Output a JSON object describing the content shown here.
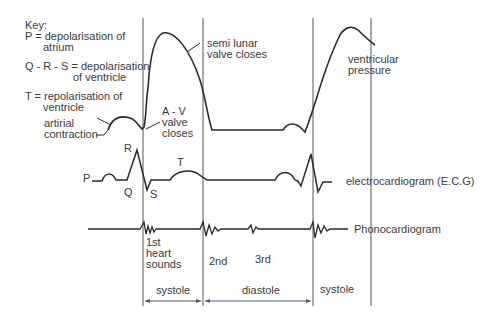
{
  "key": {
    "title": "Key:",
    "p_line1": "P = depolarisation of",
    "p_line2": "atrium",
    "qrs_line1": "Q - R - S = depolarisation",
    "qrs_line2": "of ventricle",
    "t_line1": "T = repolarisation of",
    "t_line2": "ventricle"
  },
  "annotations": {
    "atrial_1": "artirial",
    "atrial_2": "contraction",
    "av_1": "A - V",
    "av_2": "valve",
    "av_3": "closes",
    "semi_1": "semi lunar",
    "semi_2": "valve closes",
    "vp_1": "ventricular",
    "vp_2": "pressure"
  },
  "ecg": {
    "P": "P",
    "Q": "Q",
    "R": "R",
    "S": "S",
    "T": "T",
    "label": "electrocardiogram (E.C.G)"
  },
  "phono": {
    "label": "Phonocardiogram",
    "first_1": "1st",
    "first_2": "heart",
    "first_3": "sounds",
    "second": "2nd",
    "third": "3rd"
  },
  "phases": {
    "systole1": "systole",
    "diastole": "diastole",
    "systole2": "systole"
  },
  "colors": {
    "line": "#2a2a2a",
    "guide": "#555555",
    "arrow_blue": "#5a5aa8"
  }
}
